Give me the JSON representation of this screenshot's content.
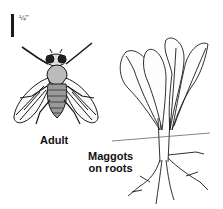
{
  "figure": {
    "scale_label": "¼\"",
    "labels": {
      "adult": "Adult",
      "maggots_line1": "Maggots",
      "maggots_line2": "on roots"
    },
    "illustrations": [
      "fly-adult-icon",
      "plant-with-roots-icon"
    ],
    "colors": {
      "ink": "#1a1a1a",
      "background": "#ffffff"
    }
  }
}
